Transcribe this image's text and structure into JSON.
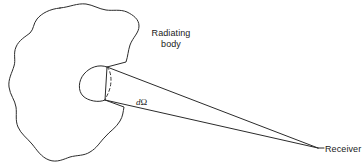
{
  "figure": {
    "background_color": "#ffffff",
    "stroke_color": "#2b2b2b",
    "text_color": "#1a1a1a",
    "width": 363,
    "height": 168
  },
  "labels": {
    "radiating_body": "Radiating\nbody",
    "radiating_body_line1": "Radiating",
    "radiating_body_line2": "body",
    "solid_angle_symbol": "d",
    "solid_angle_omega": "Ω",
    "receiver": "Receiver"
  },
  "geometry": {
    "body_outline_name": "radiating-body-blob",
    "emitting_patch_name": "emitting-aperture-ellipse",
    "hidden_edge_name": "aperture-hidden-arc",
    "cone_upper_ray_name": "cone-upper-ray",
    "cone_lower_ray_name": "cone-lower-ray",
    "receiver_point": {
      "x": 318,
      "y": 148
    },
    "aperture_center": {
      "x": 95,
      "y": 83
    },
    "aperture_rx": 15,
    "aperture_ry": 17
  }
}
